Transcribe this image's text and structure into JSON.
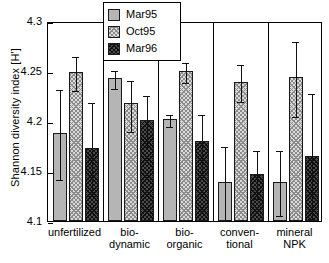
{
  "chart_data": {
    "type": "bar",
    "title": "",
    "xlabel": "",
    "ylabel": "Shannon diversity index [H']",
    "ylim": [
      4.1,
      4.3
    ],
    "yticks": [
      "4.1",
      "4.15",
      "4.2",
      "4.25",
      "4.3"
    ],
    "ytick_values": [
      4.1,
      4.15,
      4.2,
      4.25,
      4.3
    ],
    "grid": false,
    "legend_position": "top-center",
    "group_separators": true,
    "categories": [
      "unfertilized",
      "bio-\ndynamic",
      "bio-\norganic",
      "conven-\ntional",
      "mineral\nNPK"
    ],
    "series": [
      {
        "name": "Mar95",
        "values": [
          4.188,
          4.243,
          4.202,
          4.139,
          4.139
        ],
        "err_low": [
          4.143,
          4.234,
          4.196,
          4.102,
          4.107
        ],
        "err_high": [
          4.233,
          4.252,
          4.208,
          4.176,
          4.172
        ]
      },
      {
        "name": "Oct95",
        "values": [
          4.249,
          4.218,
          4.25,
          4.239,
          4.244
        ],
        "err_low": [
          4.232,
          4.191,
          4.24,
          4.221,
          4.206
        ],
        "err_high": [
          4.266,
          4.242,
          4.26,
          4.258,
          4.281
        ]
      },
      {
        "name": "Mar96",
        "values": [
          4.173,
          4.201,
          4.18,
          4.147,
          4.165
        ],
        "err_low": [
          4.127,
          4.176,
          4.148,
          4.124,
          4.104
        ],
        "err_high": [
          4.22,
          4.227,
          4.208,
          4.172,
          4.229
        ]
      }
    ]
  }
}
